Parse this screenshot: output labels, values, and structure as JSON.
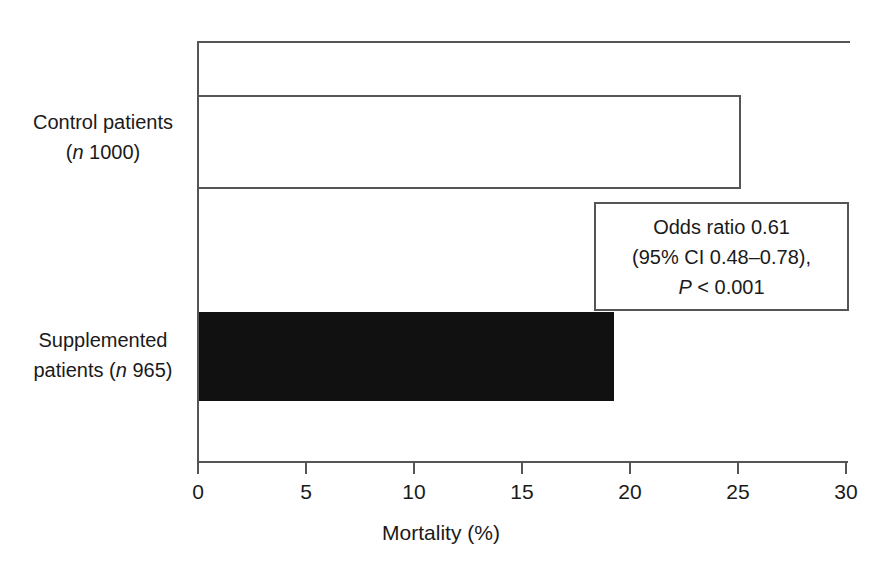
{
  "chart_data": {
    "type": "bar",
    "orientation": "horizontal",
    "title": "",
    "xlabel": "Mortality (%)",
    "ylabel": "",
    "xlim": [
      0,
      30
    ],
    "xticks": [
      0,
      5,
      10,
      15,
      20,
      25,
      30
    ],
    "xtick_labels": [
      "0",
      "5",
      "10",
      "15",
      "20",
      "25",
      "30"
    ],
    "grid": false,
    "legend": null,
    "categories": [
      "Control patients (n 1000)",
      "Supplemented patients (n 965)"
    ],
    "values": [
      25.2,
      19.2
    ],
    "bars": [
      {
        "category": "Control patients",
        "n_label": "(n 1000)",
        "value": 25.2,
        "style": "open",
        "fill": "#ffffff",
        "stroke": "#555555"
      },
      {
        "category": "Supplemented patients",
        "n_label": "(n 965)",
        "value": 19.2,
        "style": "filled",
        "fill": "#111111",
        "stroke": "#111111"
      }
    ],
    "annotations": [
      {
        "name": "statistics-box",
        "lines": [
          "Odds ratio 0.61",
          "(95% CI 0.48–0.78),",
          "P < 0.001"
        ]
      }
    ]
  },
  "labels": {
    "control_line1": "Control patients",
    "control_line2_prefix": "(",
    "control_line2_italic": "n",
    "control_line2_suffix": " 1000)",
    "supplemented_line1": "Supplemented",
    "supplemented_line2_prefix": "patients (",
    "supplemented_line2_italic": "n",
    "supplemented_line2_suffix": " 965)"
  },
  "annotation": {
    "odds_ratio": "Odds ratio 0.61",
    "ci": "(95% CI 0.48–0.78),",
    "p_italic": "P",
    "p_rest": " < 0.001"
  },
  "axis": {
    "x_title": "Mortality (%)",
    "ticks": [
      "0",
      "5",
      "10",
      "15",
      "20",
      "25",
      "30"
    ]
  },
  "colors": {
    "bar_filled": "#111111",
    "bar_open_stroke": "#555555",
    "axis": "#555555",
    "text": "#1a1a1a",
    "background": "#ffffff"
  }
}
